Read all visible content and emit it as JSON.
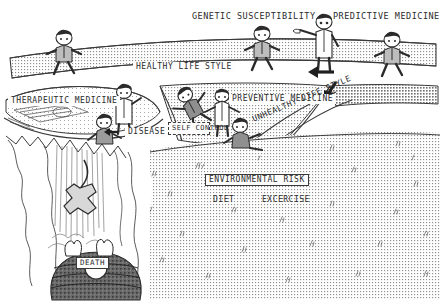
{
  "figure": {
    "style": "hand-drawn black and white cartoon diagram",
    "background_color": "#ffffff",
    "ink_color": "#2b2b2b"
  },
  "labels": {
    "genetic_susceptibility": "GENETIC SUSCEPTIBILITY",
    "predictive_medicine": "PREDICTIVE MEDICINE",
    "healthy_life_style": "HEALTHY LIFE STYLE",
    "therapeutic_medicine": "THERAPEUTIC MEDICINE",
    "preventive_medicine": "PREVENTIVE MEDICINE",
    "disease": "DISEASE",
    "self_control": "SELF CONTROL",
    "unhealthy_life_style": "UNHEALTHY LIFE STYLE",
    "environmental_risk": "ENVIRONMENTAL RISK",
    "diet": "DIET",
    "excercise": "EXCERCISE",
    "death": "DEATH"
  },
  "scene": {
    "regions": [
      {
        "name": "upper-plateau",
        "label": "HEALTHY LIFE STYLE",
        "fill": "stipple"
      },
      {
        "name": "left-basin",
        "label": "THERAPEUTIC MEDICINE",
        "fill": "stipple"
      },
      {
        "name": "central-valley",
        "label": "PREVENTIVE MEDICINE",
        "fill": "stipple"
      },
      {
        "name": "right-slope",
        "label": "UNHEALTHY LIFE STYLE",
        "fill": "stipple"
      },
      {
        "name": "lower-plain",
        "label": "ENVIRONMENTAL RISK",
        "fill": "stipple"
      },
      {
        "name": "chasm-cliff",
        "label": "DEATH",
        "fill": "white-with-hatching"
      }
    ],
    "figures": [
      {
        "name": "walker-upper-left",
        "type": "businessman-walking",
        "x": 64,
        "y": 48
      },
      {
        "name": "walker-upper-center",
        "type": "businessman-walking",
        "x": 262,
        "y": 44
      },
      {
        "name": "doctor-pointing",
        "type": "doctor-white-coat-pointing-left",
        "x": 322,
        "y": 30
      },
      {
        "name": "walker-upper-right",
        "type": "businessman-walking",
        "x": 392,
        "y": 50
      },
      {
        "name": "doctor-left-basin",
        "type": "doctor-white-coat",
        "x": 124,
        "y": 100
      },
      {
        "name": "patient-left-basin",
        "type": "seated-patient",
        "x": 104,
        "y": 128
      },
      {
        "name": "falling-businessman",
        "type": "businessman-tumbling",
        "x": 188,
        "y": 100
      },
      {
        "name": "doctor-valley",
        "type": "doctor-white-coat-arms-out",
        "x": 222,
        "y": 103
      },
      {
        "name": "seated-figure-valley",
        "type": "seated-person",
        "x": 238,
        "y": 131
      },
      {
        "name": "falling-figure-chasm",
        "type": "person-falling-with-rope",
        "x": 86,
        "y": 212
      },
      {
        "name": "figure-in-pit",
        "type": "person-in-cauldron",
        "x": 96,
        "y": 258
      }
    ],
    "arrows": [
      {
        "name": "arrow-left-horizontal",
        "direction": "left",
        "x": 318,
        "y": 72
      },
      {
        "name": "arrow-down-left-diagonal",
        "direction": "down-left",
        "x": 330,
        "y": 88
      },
      {
        "name": "arrow-disease-pointer",
        "direction": "left",
        "x": 160,
        "y": 130
      }
    ]
  }
}
